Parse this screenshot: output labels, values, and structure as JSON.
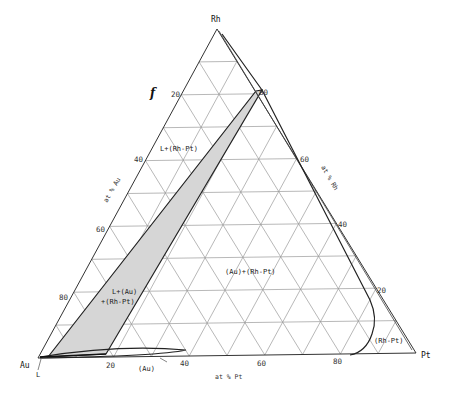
{
  "figure_label": "f",
  "vertices": {
    "top": "Rh",
    "left": "Au",
    "right": "Pt"
  },
  "axis_titles": {
    "left": "at % Au",
    "right": "at % Rh",
    "bottom": "at % Pt"
  },
  "ticks": {
    "left": [
      "20",
      "40",
      "60",
      "80"
    ],
    "right": [
      "80",
      "60",
      "40",
      "20"
    ],
    "bottom": [
      "20",
      "40",
      "60",
      "80"
    ]
  },
  "regions": {
    "liquid_rhpt": "L+(Rh-Pt)",
    "liquid_au_rhpt_line1": "L+(Au)",
    "liquid_au_rhpt_line2": "+(Rh-Pt)",
    "au_rhpt": "(Au)+(Rh-Pt)",
    "rhpt": "(Rh-Pt)",
    "au": "(Au)",
    "liquid": "L"
  },
  "colors": {
    "grid": "#9a9a9a",
    "boundary": "#222222",
    "shade": "#d6d6d6"
  }
}
